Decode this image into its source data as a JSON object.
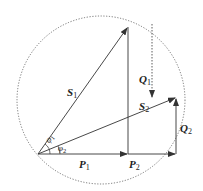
{
  "diagram": {
    "type": "power-vector-diagram",
    "colors": {
      "line": "#333333",
      "circle": "#555555",
      "background": "#ffffff"
    },
    "geometry": {
      "origin": [
        38,
        154
      ],
      "circle": {
        "cx": 101,
        "cy": 100,
        "r": 84
      },
      "S1_tip": [
        128,
        26
      ],
      "S2_tip": [
        176,
        98
      ],
      "P1_end": [
        128,
        154
      ],
      "P2_end": [
        176,
        154
      ],
      "Q1_dashed": {
        "from": [
          152,
          24
        ],
        "to": [
          152,
          98
        ]
      }
    },
    "labels": {
      "S1": {
        "main": "S",
        "sub": "1"
      },
      "S2": {
        "main": "S",
        "sub": "2"
      },
      "Q1": {
        "main": "Q",
        "sub": "1"
      },
      "Q2": {
        "main": "Q",
        "sub": "2"
      },
      "P1": {
        "main": "P",
        "sub": "1"
      },
      "P2": {
        "main": "P",
        "sub": "2"
      },
      "phi1": {
        "main": "φ",
        "sub": "1"
      },
      "phi2": {
        "main": "φ",
        "sub": "2"
      }
    }
  }
}
